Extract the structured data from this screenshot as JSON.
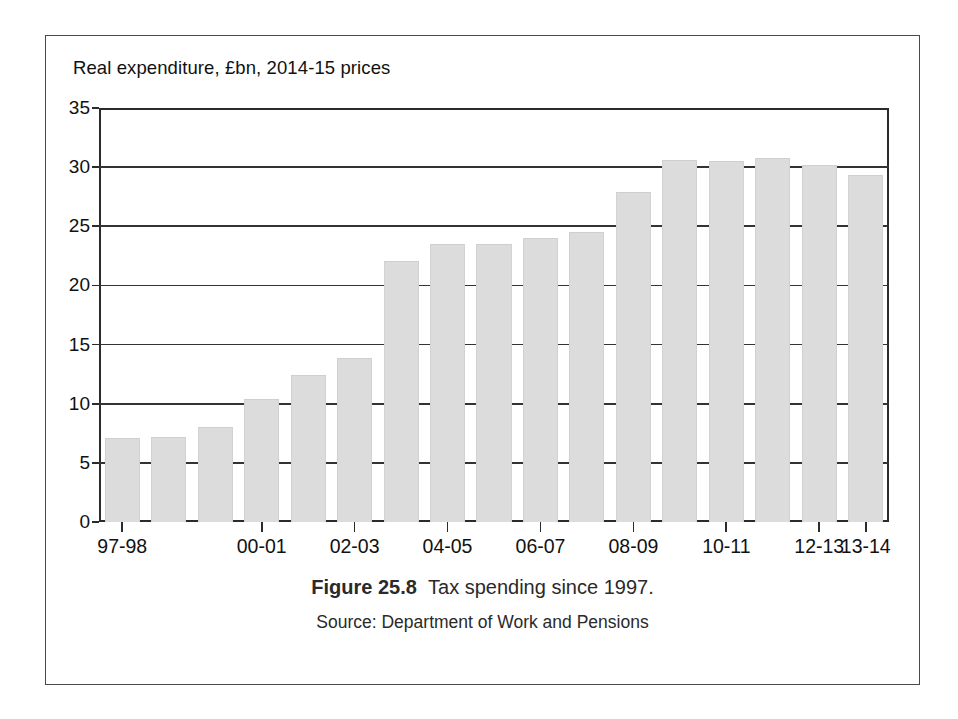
{
  "chart_data": {
    "type": "bar",
    "title": "Real expenditure, £bn, 2014-15 prices",
    "xlabel": "",
    "ylabel": "Real expenditure, £bn, 2014-15 prices",
    "ylim": [
      0,
      35
    ],
    "yticks": [
      0,
      5,
      10,
      15,
      20,
      25,
      30,
      35
    ],
    "ytick_labels": [
      "0",
      "5",
      "10",
      "15",
      "20",
      "25",
      "30",
      "35"
    ],
    "grid": true,
    "legend": null,
    "categories": [
      "97-98",
      "98-99",
      "99-00",
      "00-01",
      "01-02",
      "02-03",
      "03-04",
      "04-05",
      "05-06",
      "06-07",
      "07-08",
      "08-09",
      "09-10",
      "10-11",
      "11-12",
      "12-13",
      "13-14"
    ],
    "labelled_categories": [
      "97-98",
      "00-01",
      "02-03",
      "04-05",
      "06-07",
      "08-09",
      "10-11",
      "12-13",
      "13-14"
    ],
    "values": [
      7.1,
      7.2,
      8.0,
      10.4,
      12.4,
      13.9,
      22.1,
      23.5,
      23.5,
      24.0,
      24.5,
      27.9,
      30.6,
      30.5,
      30.8,
      30.2,
      29.3
    ],
    "bar_color": "#dcdcdc",
    "axis_color": "#2b2b2b"
  },
  "figure": {
    "number_label": "Figure 25.8",
    "caption_text": "Tax spending since 1997.",
    "source": "Source: Department of Work and Pensions"
  }
}
